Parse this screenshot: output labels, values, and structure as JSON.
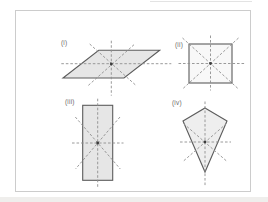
{
  "figure": {
    "panels": [
      {
        "label": "(i)",
        "shape": "parallelogram"
      },
      {
        "label": "(ii)",
        "shape": "square"
      },
      {
        "label": "(iii)",
        "shape": "rectangle"
      },
      {
        "label": "(iv)",
        "shape": "kite"
      }
    ]
  },
  "colors": {
    "page-bg": "#ffffff",
    "box-border": "#cccccc",
    "shape-outline": "#5c5c5c",
    "dashed-line": "#8f8f8f",
    "fill-gray": "#e6e6e6",
    "fill-pale": "#f8f8f8",
    "fill-soft": "#eeeeee",
    "center-dot": "#3c3c3c",
    "label-text": "#6b6b6b",
    "edge-band": "#efeeec"
  }
}
